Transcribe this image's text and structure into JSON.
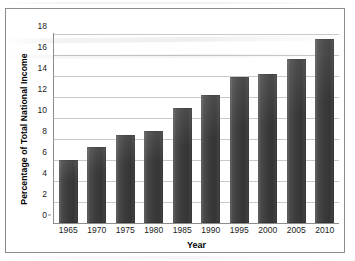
{
  "chart_data": {
    "type": "bar",
    "title": "",
    "xlabel": "Year",
    "ylabel": "Percentage of Total National Income",
    "categories": [
      "1965",
      "1970",
      "1975",
      "1980",
      "1985",
      "1990",
      "1995",
      "2000",
      "2005",
      "2010"
    ],
    "values": [
      6.0,
      7.2,
      8.4,
      8.8,
      11.0,
      12.2,
      13.9,
      14.2,
      15.6,
      17.5
    ],
    "ylim": [
      0,
      18
    ],
    "y_ticks": [
      "0",
      "2",
      "4",
      "6",
      "8",
      "10",
      "12",
      "14",
      "16",
      "18"
    ],
    "y_tick_values": [
      0,
      2,
      4,
      6,
      8,
      10,
      12,
      14,
      16,
      18
    ],
    "grid": true,
    "legend": "none",
    "bar_color": "#3c3c3c",
    "gridline_color": "#c9c9c9",
    "axis_color": "#8d8d8d",
    "frame_color": "#8d8d8d",
    "background_color": "#ffffff"
  }
}
